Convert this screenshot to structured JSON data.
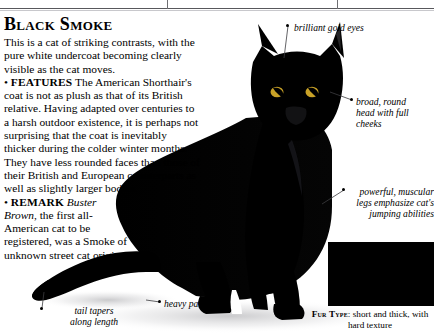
{
  "page": {
    "title": "Black Smoke",
    "background_color": "#ffffff",
    "text_color": "#000000"
  },
  "article": {
    "intro": "This is a cat of striking contrasts, with the pure white undercoat becoming clearly visible as the cat moves.",
    "sections": [
      {
        "label": "FEATURES",
        "bullet": "•",
        "text": "The American Shorthair's coat is not as plush as that of its British relative. Having adapted over centuries to a harsh outdoor existence, it is perhaps not surprising that the coat is inevitably thicker during the colder winter months. They have less rounded faces than those of their British and European counterparts as well as slightly larger bodies."
      },
      {
        "label": "REMARK",
        "bullet": "•",
        "emphasis": "Buster Brown",
        "text": ", the first all-American cat to be registered, was a Smoke of unknown street cat origins."
      }
    ]
  },
  "annotations": [
    {
      "id": "brilliant-gold-eyes",
      "text": "brilliant gold eyes"
    },
    {
      "id": "broad-round-head",
      "text": "broad, round\nhead with full\ncheeks"
    },
    {
      "id": "powerful-legs",
      "text": "powerful, muscular\nlegs emphasize cat's\njumping abilities"
    },
    {
      "id": "tail-tapers",
      "text": "tail tapers\nalong length"
    },
    {
      "id": "heavy-paws",
      "text": "heavy paws"
    }
  ],
  "fur_type": {
    "label": "Fur Type",
    "separator": ": ",
    "description": "short and\nthick, with hard texture",
    "swatch_color": "#000000"
  },
  "subject": {
    "name": "black smoke cat",
    "silhouette_color": "#000000"
  }
}
